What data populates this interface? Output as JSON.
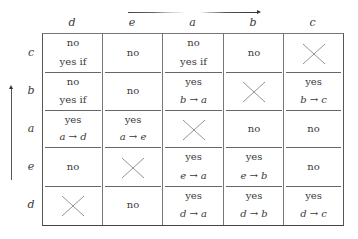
{
  "column_headers": [
    "d",
    "e",
    "a",
    "b",
    "c"
  ],
  "row_headers": [
    "c",
    "b",
    "a",
    "e",
    "d"
  ],
  "arrows": {
    "top": "right-arrow",
    "left": "up-arrow"
  },
  "rows": [
    {
      "row": "c",
      "cells": [
        {
          "type": "text2",
          "line1": "no",
          "line2": "yes if"
        },
        {
          "type": "text1",
          "text": "no"
        },
        {
          "type": "text2",
          "line1": "no",
          "line2": "yes if"
        },
        {
          "type": "text1",
          "text": "no"
        },
        {
          "type": "cross"
        }
      ]
    },
    {
      "row": "b",
      "cells": [
        {
          "type": "text2",
          "line1": "no",
          "line2": "yes if"
        },
        {
          "type": "text1",
          "text": "no"
        },
        {
          "type": "text2",
          "line1": "yes",
          "line2": "b → a",
          "italic": true
        },
        {
          "type": "cross"
        },
        {
          "type": "text2",
          "line1": "yes",
          "line2": "b → c",
          "italic": true
        }
      ]
    },
    {
      "row": "a",
      "cells": [
        {
          "type": "text2",
          "line1": "yes",
          "line2": "a → d",
          "italic": true
        },
        {
          "type": "text2",
          "line1": "yes",
          "line2": "a → e",
          "italic": true
        },
        {
          "type": "cross"
        },
        {
          "type": "text1",
          "text": "no"
        },
        {
          "type": "text1",
          "text": "no"
        }
      ]
    },
    {
      "row": "e",
      "cells": [
        {
          "type": "text1",
          "text": "no"
        },
        {
          "type": "cross"
        },
        {
          "type": "text2",
          "line1": "yes",
          "line2": "e → a",
          "italic": true
        },
        {
          "type": "text2",
          "line1": "yes",
          "line2": "e → b",
          "italic": true
        },
        {
          "type": "text1",
          "text": "no"
        }
      ]
    },
    {
      "row": "d",
      "cells": [
        {
          "type": "cross"
        },
        {
          "type": "text1",
          "text": "no"
        },
        {
          "type": "text2",
          "line1": "yes",
          "line2": "d → a",
          "italic": true
        },
        {
          "type": "text2",
          "line1": "yes",
          "line2": "d → b",
          "italic": true
        },
        {
          "type": "text2",
          "line1": "yes",
          "line2": "d → c",
          "italic": true
        }
      ]
    }
  ]
}
